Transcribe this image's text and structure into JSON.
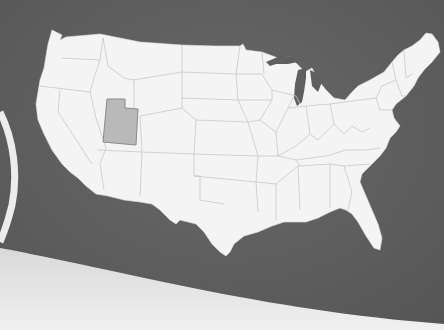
{
  "map": {
    "region": "United States (contiguous 48 states)",
    "highlighted_state": "Utah",
    "colors": {
      "background": "#5f5f5f",
      "land": "#f4f4f4",
      "state_border": "#c8c8c8",
      "highlight_fill": "#b9b9b9",
      "highlight_border": "#8a8a8a",
      "bottom_panel": "#e6e6e6",
      "left_ring": "#ececec"
    }
  }
}
